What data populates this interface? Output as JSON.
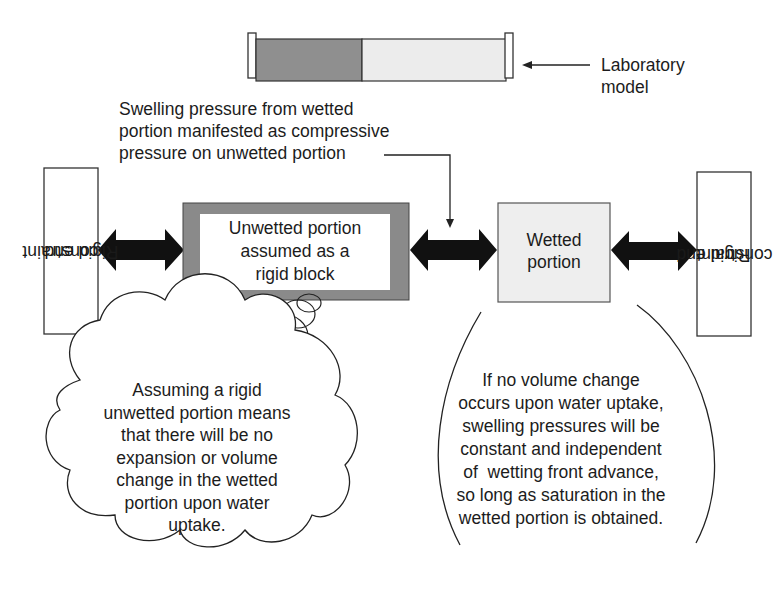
{
  "lab_model": {
    "label_line1": "Laboratory",
    "label_line2": "model",
    "colors": {
      "wetted_segment": "#8f8f8f",
      "unwetted_segment": "#ececec"
    }
  },
  "swelling_note": {
    "line1": "Swelling pressure from wetted",
    "line2": "portion manifested as compressive",
    "line3": "pressure on unwetted portion"
  },
  "left_constraint": {
    "line1": "Rigid end",
    "line2": "constraint"
  },
  "right_constraint": {
    "line1": "Rigid end",
    "line2": "constraint"
  },
  "unwetted_block": {
    "line1": "Unwetted portion",
    "line2": "assumed as a",
    "line3": "rigid block",
    "border_color": "#8a8a8a"
  },
  "wetted_block": {
    "line1": "Wetted",
    "line2": "portion",
    "fill_color": "#eeeeee"
  },
  "thought_bubble": {
    "lines": [
      "Assuming a rigid",
      "unwetted portion means",
      "that there will be no",
      "expansion or volume",
      "change in the wetted",
      "portion upon water",
      "uptake."
    ]
  },
  "callout": {
    "lines": [
      "If no volume change",
      "occurs upon water uptake,",
      "swelling pressures will be",
      "constant and independent",
      "of  wetting front advance,",
      "so long as saturation in the",
      "wetted portion is obtained."
    ]
  }
}
